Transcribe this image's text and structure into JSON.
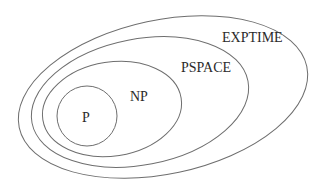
{
  "diagram": {
    "type": "nested-sets",
    "stroke_color": "#6e6e6e",
    "label_color": "#2a2a2a",
    "sets": [
      {
        "id": "exptime",
        "label": "EXPTIME",
        "shape": "ellipse",
        "cx": 163,
        "cy": 97,
        "rx": 147,
        "ry": 77,
        "rotate": -12,
        "label_x": 222,
        "label_y": 42
      },
      {
        "id": "pspace",
        "label": "PSPACE",
        "shape": "ellipse",
        "cx": 140,
        "cy": 102,
        "rx": 110,
        "ry": 63,
        "rotate": -11,
        "label_x": 181,
        "label_y": 72
      },
      {
        "id": "np",
        "label": "NP",
        "shape": "ellipse",
        "cx": 112,
        "cy": 109,
        "rx": 70,
        "ry": 47,
        "rotate": -9,
        "label_x": 130,
        "label_y": 101
      },
      {
        "id": "p",
        "label": "P",
        "shape": "circle",
        "cx": 87,
        "cy": 116,
        "rx": 30,
        "ry": 30,
        "rotate": 0,
        "label_x": 82,
        "label_y": 122
      }
    ],
    "containment": [
      "P ⊆ NP",
      "NP ⊆ PSPACE",
      "PSPACE ⊆ EXPTIME"
    ]
  }
}
